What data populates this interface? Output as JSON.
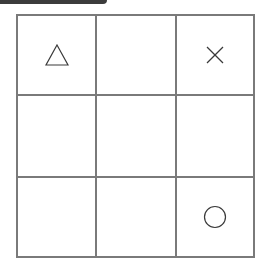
{
  "game": "tic-tac-toe",
  "board": {
    "rows": 3,
    "cols": 3,
    "cells": [
      [
        "triangle",
        "",
        "cross"
      ],
      [
        "",
        "",
        ""
      ],
      [
        "",
        "",
        "circle"
      ]
    ]
  },
  "colors": {
    "grid_line": "#7a7a7a",
    "mark": "#3a3a3a",
    "top_bar": "#3c3c3c",
    "background": "#ffffff"
  }
}
